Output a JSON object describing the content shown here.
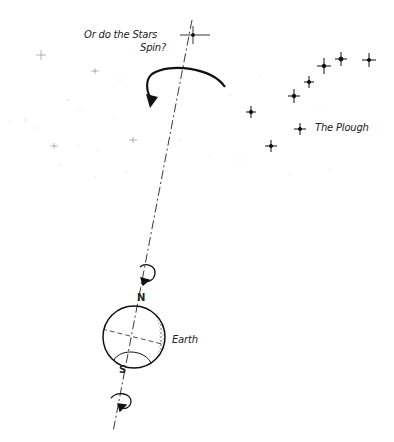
{
  "diagram": {
    "question_label_line1": "Or do the Stars",
    "question_label_line2": "Spin?",
    "constellation_label": "The Plough",
    "planet_label": "Earth",
    "north_pole_label": "N",
    "south_pole_label": "S"
  },
  "colors": {
    "ink": "#1a1a1a",
    "background": "#ffffff",
    "speckle": "#bbbbbb"
  }
}
